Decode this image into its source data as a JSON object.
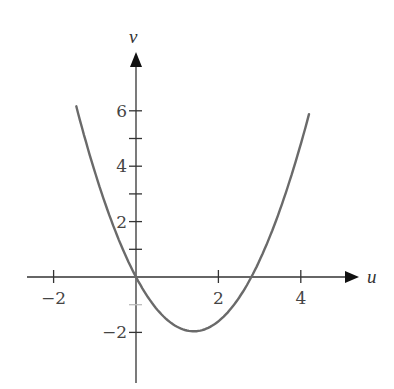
{
  "chart_data": {
    "type": "line",
    "title": "",
    "xlabel": "u",
    "ylabel": "v",
    "xlim": [
      -2.6,
      5.5
    ],
    "ylim": [
      -3.8,
      8.2
    ],
    "grid": false,
    "legend": null,
    "x_ticks": [
      -2,
      2,
      4
    ],
    "x_tick_labels": [
      "−2",
      "2",
      "4"
    ],
    "y_ticks_major": [
      -2,
      2,
      4,
      6
    ],
    "y_tick_labels": [
      "−2",
      "2",
      "4",
      "6"
    ],
    "y_ticks_minor": [
      -1,
      1,
      3,
      5
    ],
    "series": [
      {
        "name": "v(u)",
        "description": "parabola opening upward, passes through origin, vertex near (1.4, -2), crosses u-axis near 2.8",
        "x": [
          -1.45,
          -1,
          -0.5,
          0,
          0.5,
          1,
          1.4,
          2,
          2.5,
          2.8,
          3,
          3.5,
          4,
          4.2
        ],
        "y": [
          6.1,
          3.8,
          1.65,
          0,
          -1.15,
          -1.8,
          -1.96,
          -1.6,
          -0.75,
          0,
          0.6,
          2.45,
          4.8,
          5.9
        ],
        "color": "#6a6a6a"
      }
    ],
    "colors": {
      "axis": "#333333",
      "curve": "#6a6a6a",
      "background": "#ffffff"
    }
  }
}
